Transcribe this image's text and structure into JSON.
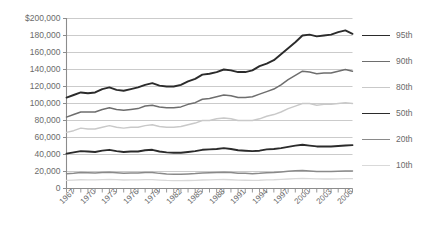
{
  "chart_data": {
    "type": "line",
    "title": "",
    "xlabel": "",
    "ylabel": "",
    "ylim": [
      0,
      200000
    ],
    "ytick_values": [
      0,
      20000,
      40000,
      60000,
      80000,
      100000,
      120000,
      140000,
      160000,
      180000,
      200000
    ],
    "ytick_labels": [
      "0",
      "20,000",
      "40,000",
      "60,000",
      "80,000",
      "100,000",
      "120,000",
      "140,000",
      "160,000",
      "180,000",
      "$200,000"
    ],
    "grid": true,
    "legend_position": "right",
    "x": [
      1967,
      1968,
      1969,
      1970,
      1971,
      1972,
      1973,
      1974,
      1975,
      1976,
      1977,
      1978,
      1979,
      1980,
      1981,
      1982,
      1983,
      1984,
      1985,
      1986,
      1987,
      1988,
      1989,
      1990,
      1991,
      1992,
      1993,
      1994,
      1995,
      1996,
      1997,
      1998,
      1999,
      2000,
      2001,
      2002,
      2003,
      2004,
      2005,
      2006,
      2007
    ],
    "xtick_labels": [
      "1967",
      "1970",
      "1973",
      "1976",
      "1979",
      "1982",
      "1985",
      "1988",
      "1991",
      "1994",
      "1997",
      "2000",
      "2003",
      "2006"
    ],
    "xtick_years": [
      1967,
      1970,
      1973,
      1976,
      1979,
      1982,
      1985,
      1988,
      1991,
      1994,
      1997,
      2000,
      2003,
      2006
    ],
    "series": [
      {
        "name": "95th",
        "color": "#2b2b2b",
        "width": 1.9,
        "values": [
          107000,
          110000,
          113000,
          112000,
          113000,
          117000,
          119000,
          116000,
          115000,
          117000,
          119000,
          122000,
          124000,
          121000,
          120000,
          120000,
          122000,
          126000,
          129000,
          134000,
          135000,
          137000,
          140000,
          139000,
          137000,
          137000,
          139000,
          144000,
          147000,
          151000,
          158000,
          165000,
          172000,
          180000,
          181000,
          179000,
          180000,
          181000,
          184000,
          186000,
          182000
        ]
      },
      {
        "name": "90th",
        "color": "#6e6e6e",
        "width": 1.5,
        "values": [
          84000,
          87000,
          90000,
          90000,
          90000,
          93000,
          95000,
          93000,
          92000,
          93000,
          94000,
          97000,
          98000,
          96000,
          95000,
          95000,
          96000,
          99000,
          101000,
          105000,
          106000,
          108000,
          110000,
          109000,
          107000,
          107000,
          108000,
          111000,
          114000,
          117000,
          122000,
          128000,
          133000,
          138000,
          137000,
          135000,
          136000,
          136000,
          138000,
          140000,
          138000
        ]
      },
      {
        "name": "80th",
        "color": "#c9c9c9",
        "width": 1.4,
        "values": [
          66000,
          68000,
          71000,
          70000,
          70000,
          72000,
          74000,
          72000,
          71000,
          72000,
          72000,
          74000,
          75000,
          73000,
          72000,
          72000,
          73000,
          75000,
          77000,
          80000,
          80000,
          82000,
          83000,
          82000,
          80000,
          80000,
          80000,
          82000,
          85000,
          87000,
          90000,
          94000,
          97000,
          100000,
          100000,
          98000,
          99000,
          99000,
          100000,
          101000,
          100000
        ]
      },
      {
        "name": "50th",
        "color": "#2b2b2b",
        "width": 1.9,
        "values": [
          41000,
          42500,
          44000,
          43500,
          43000,
          44500,
          45500,
          44000,
          43000,
          43500,
          43500,
          45000,
          45500,
          43500,
          42500,
          42000,
          42000,
          43000,
          44000,
          45500,
          46000,
          46500,
          47500,
          46500,
          45000,
          44500,
          44000,
          44500,
          46000,
          46500,
          47500,
          49000,
          50500,
          51500,
          50500,
          49500,
          49500,
          49500,
          50000,
          50500,
          51000
        ]
      },
      {
        "name": "20th",
        "color": "#8a8a8a",
        "width": 1.5,
        "values": [
          17500,
          18000,
          18800,
          18500,
          18300,
          18800,
          19200,
          18600,
          18000,
          18200,
          18200,
          18800,
          18800,
          17800,
          17200,
          16900,
          16800,
          17200,
          17600,
          18200,
          18500,
          18800,
          19200,
          18800,
          18000,
          17800,
          17400,
          17800,
          18500,
          18900,
          19500,
          20200,
          20800,
          21200,
          20600,
          20100,
          20000,
          20000,
          20200,
          20500,
          20600
        ]
      },
      {
        "name": "10th",
        "color": "#d9d9d9",
        "width": 1.3,
        "values": [
          9500,
          9900,
          10300,
          10200,
          10100,
          10400,
          10700,
          10400,
          10000,
          10100,
          10100,
          10400,
          10400,
          9900,
          9500,
          9300,
          9200,
          9400,
          9600,
          10000,
          10200,
          10400,
          10600,
          10300,
          9900,
          9700,
          9500,
          9700,
          10100,
          10300,
          10700,
          11200,
          11600,
          11900,
          11600,
          11300,
          11200,
          11200,
          11400,
          11500,
          11600
        ]
      }
    ]
  },
  "legend": {
    "items": [
      {
        "label": "95th"
      },
      {
        "label": "90th"
      },
      {
        "label": "80th"
      },
      {
        "label": "50th"
      },
      {
        "label": "20th"
      },
      {
        "label": "10th"
      }
    ]
  }
}
